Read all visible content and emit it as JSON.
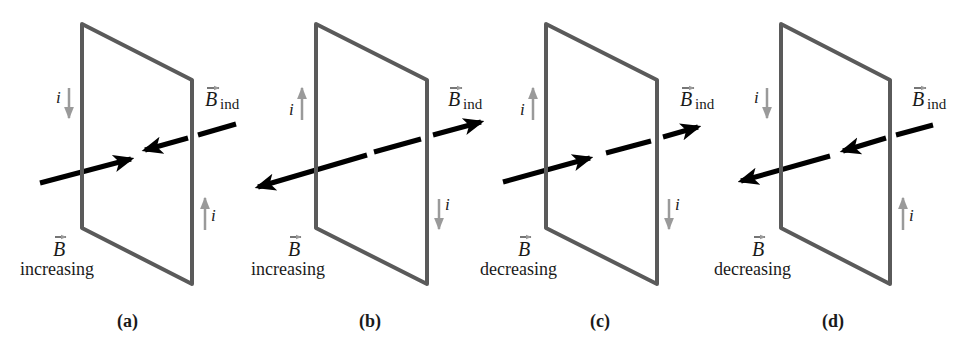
{
  "colors": {
    "loop": "#5a5a5a",
    "field_arrow": "#000000",
    "current_arrow": "#9a9a9a",
    "text": "#1a1a1a"
  },
  "symbols": {
    "field": "B",
    "induced_field": "B",
    "induced_subscript": "ind",
    "current": "i"
  },
  "panels": [
    {
      "id": "a",
      "caption": "(a)",
      "field_state": "increasing",
      "b_direction": "right",
      "b_ind_direction": "left",
      "left_current": "down",
      "right_current": "up"
    },
    {
      "id": "b",
      "caption": "(b)",
      "field_state": "increasing",
      "b_direction": "left",
      "b_ind_direction": "right",
      "left_current": "up",
      "right_current": "down"
    },
    {
      "id": "c",
      "caption": "(c)",
      "field_state": "decreasing",
      "b_direction": "right",
      "b_ind_direction": "right",
      "left_current": "up",
      "right_current": "down"
    },
    {
      "id": "d",
      "caption": "(d)",
      "field_state": "decreasing",
      "b_direction": "left",
      "b_ind_direction": "left",
      "left_current": "down",
      "right_current": "up"
    }
  ]
}
